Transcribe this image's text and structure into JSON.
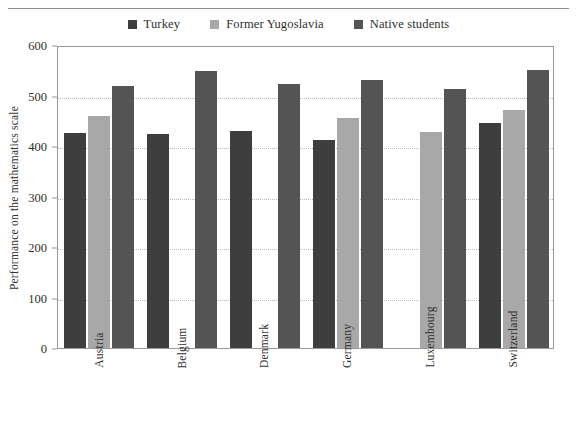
{
  "chart_data": {
    "type": "bar",
    "title": "",
    "subtitle": "",
    "xlabel": "",
    "ylabel": "Performance on the mathematics scale",
    "ylim": [
      0,
      600
    ],
    "yticks": [
      0,
      100,
      200,
      300,
      400,
      500,
      600
    ],
    "ytick_labels": [
      "0",
      "100",
      "200",
      "300",
      "400",
      "500",
      "600"
    ],
    "grid": "horizontal-dotted",
    "legend_position": "top-center",
    "categories": [
      "Austria",
      "Belgium",
      "Denmark",
      "Germany",
      "Luxembourg",
      "Switzerland"
    ],
    "series": [
      {
        "name": "Turkey",
        "color": "#3e3e3e",
        "values": [
          425,
          424,
          429,
          412,
          null,
          445
        ]
      },
      {
        "name": "Former Yugoslavia",
        "color": "#a8a8a8",
        "values": [
          460,
          null,
          null,
          455,
          427,
          472
        ]
      },
      {
        "name": "Native students",
        "color": "#545454",
        "values": [
          518,
          549,
          523,
          531,
          512,
          551
        ]
      }
    ]
  },
  "legend": {
    "entries": [
      {
        "label": "Turkey",
        "color": "#3e3e3e"
      },
      {
        "label": "Former Yugoslavia",
        "color": "#a8a8a8"
      },
      {
        "label": "Native students",
        "color": "#545454"
      }
    ]
  },
  "axes": {
    "y_title": "Performance on the mathematics scale"
  }
}
